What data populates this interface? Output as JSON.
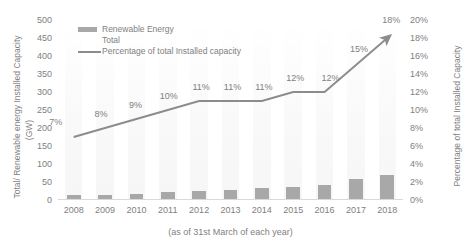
{
  "chart_data": {
    "type": "bar",
    "title": "",
    "subtitle": "",
    "xlabel": "(as of 31st March of each year)",
    "ylabel": "Total/ Renewable energy Installed Capacity",
    "ylabel_unit": "(GW)",
    "y2label": "Percentage of total Installed Capacity",
    "categories": [
      "2008",
      "2009",
      "2010",
      "2011",
      "2012",
      "2013",
      "2014",
      "2015",
      "2016",
      "2017",
      "2018"
    ],
    "series": [
      {
        "name": "Renewable Energy Total",
        "type": "bar",
        "axis": "left",
        "unit": "GW",
        "values": [
          13,
          15,
          17,
          21,
          25,
          28,
          32,
          36,
          43,
          57,
          70
        ]
      },
      {
        "name": "Percentage of total Installed capacity",
        "type": "line",
        "axis": "right",
        "unit": "%",
        "values": [
          7,
          8,
          9,
          10,
          11,
          11,
          11,
          12,
          12,
          15,
          18
        ],
        "point_labels": [
          "7%",
          "8%",
          "9%",
          "10%",
          "11%",
          "11%",
          "11%",
          "12%",
          "12%",
          "15%",
          "18%"
        ],
        "arrow_end": true
      }
    ],
    "ylim": [
      0,
      500
    ],
    "yticks": [
      0,
      50,
      100,
      150,
      200,
      250,
      300,
      350,
      400,
      450,
      500
    ],
    "ytick_labels": [
      "0",
      "50",
      "100",
      "150",
      "200",
      "250",
      "300",
      "350",
      "400",
      "450",
      "500"
    ],
    "y2lim": [
      0,
      20
    ],
    "y2ticks": [
      0,
      2,
      4,
      6,
      8,
      10,
      12,
      14,
      16,
      18,
      20
    ],
    "y2tick_labels": [
      "0%",
      "2%",
      "4%",
      "6%",
      "8%",
      "10%",
      "12%",
      "14%",
      "16%",
      "18%",
      "20%"
    ],
    "grid": false,
    "legend": {
      "position": "top-left",
      "entries": [
        {
          "label_line1": "Renewable Energy",
          "label_line2": "Total",
          "marker": "bar-swatch"
        },
        {
          "label_line1": "Percentage of total Installed capacity",
          "label_line2": "",
          "marker": "line-swatch"
        }
      ]
    },
    "colors": {
      "bar": "#a8a8a8",
      "line": "#8c8c8c",
      "text": "#7f7f7f",
      "axis": "#d9d9d9",
      "background": "#ffffff"
    }
  }
}
